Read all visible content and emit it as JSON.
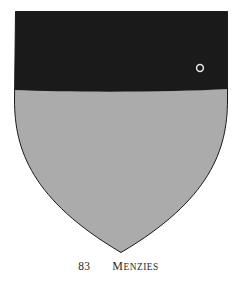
{
  "page": {
    "background_color": "#ffffff",
    "width": 237,
    "height": 283
  },
  "shield": {
    "name": "heraldic-shield",
    "description": "escutcheon",
    "outline_color": "#000000",
    "field": {
      "label": "field",
      "tincture_name": "argent-rendered-gray",
      "color": "#ababab"
    },
    "chief": {
      "label": "chief",
      "tincture_name": "sable",
      "color": "#1a1a1a",
      "height_fraction": 0.31
    },
    "charge": {
      "label": "annulet",
      "symbol": "○",
      "color": "#e8e8e8",
      "center_x": 200,
      "center_y": 68,
      "diameter": 7
    }
  },
  "caption": {
    "number": "83",
    "name": "Menzies",
    "name_first_letter": "M",
    "name_rest": "enzies",
    "color": "#2a2a2a"
  }
}
